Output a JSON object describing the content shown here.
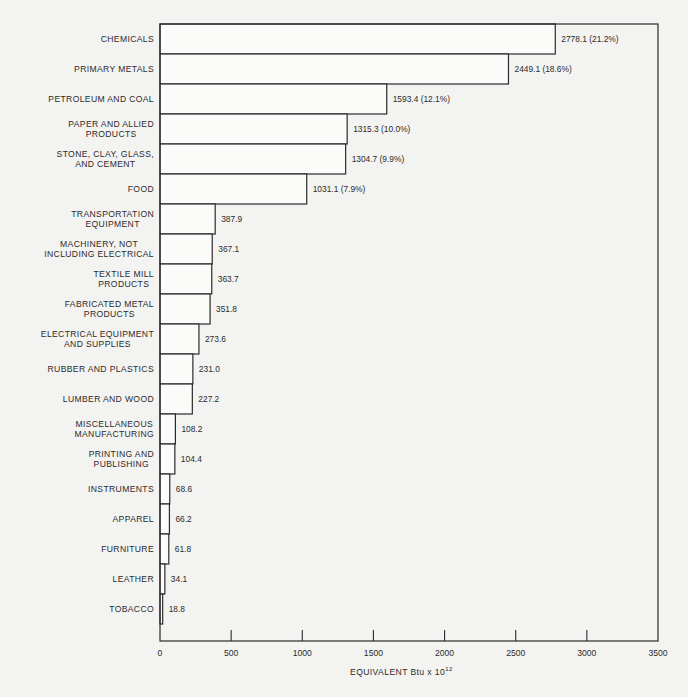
{
  "chart_data": {
    "type": "bar",
    "orientation": "horizontal",
    "title": "",
    "xlabel": "EQUIVALENT Btu x 10",
    "xlabel_superscript": "12",
    "ylabel": "",
    "xlim": [
      0,
      3500
    ],
    "xticks": [
      0,
      500,
      1000,
      1500,
      2000,
      2500,
      3000,
      3500
    ],
    "xtick_labels": [
      "0",
      "500",
      "1000",
      "1500",
      "2000",
      "2500",
      "3000",
      "3500"
    ],
    "grid": false,
    "legend": null,
    "categories": [
      [
        "CHEMICALS"
      ],
      [
        "PRIMARY METALS"
      ],
      [
        "PETROLEUM AND COAL"
      ],
      [
        "PAPER AND ALLIED",
        "PRODUCTS"
      ],
      [
        "STONE, CLAY, GLASS,",
        "AND CEMENT"
      ],
      [
        "FOOD"
      ],
      [
        "TRANSPORTATION",
        "EQUIPMENT"
      ],
      [
        "MACHINERY, NOT",
        "INCLUDING ELECTRICAL"
      ],
      [
        "TEXTILE MILL",
        "PRODUCTS"
      ],
      [
        "FABRICATED METAL",
        "PRODUCTS"
      ],
      [
        "ELECTRICAL EQUIPMENT",
        "AND SUPPLIES"
      ],
      [
        "RUBBER AND PLASTICS"
      ],
      [
        "LUMBER AND WOOD"
      ],
      [
        "MISCELLANEOUS",
        "MANUFACTURING"
      ],
      [
        "PRINTING AND",
        "PUBLISHING"
      ],
      [
        "INSTRUMENTS"
      ],
      [
        "APPAREL"
      ],
      [
        "FURNITURE"
      ],
      [
        "LEATHER"
      ],
      [
        "TOBACCO"
      ]
    ],
    "values": [
      2778.1,
      2449.1,
      1593.4,
      1315.3,
      1304.7,
      1031.1,
      387.9,
      367.1,
      363.7,
      351.8,
      273.6,
      231.0,
      227.2,
      108.2,
      104.4,
      68.6,
      66.2,
      61.8,
      34.1,
      18.8
    ],
    "value_labels": [
      "2778.1 (21.2%)",
      "2449.1 (18.6%)",
      "1593.4 (12.1%)",
      "1315.3 (10.0%)",
      "1304.7 (9.9%)",
      "1031.1 (7.9%)",
      "387.9",
      "367.1",
      "363.7",
      "351.8",
      "273.6",
      "231.0",
      "227.2",
      "108.2",
      "104.4",
      "68.6",
      "66.2",
      "61.8",
      "34.1",
      "18.8"
    ]
  }
}
